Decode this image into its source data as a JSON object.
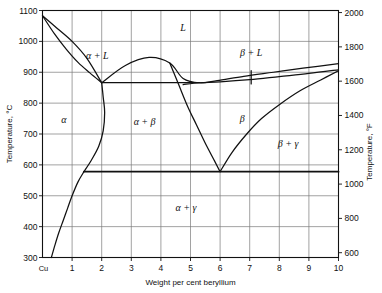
{
  "figure": {
    "kind": "binary-phase-diagram",
    "system": "Cu-Be"
  },
  "axes": {
    "x_title": "Weight per cent beryllium",
    "y_left_title": "Temperature, °C",
    "y_right_title": "Temperature, °F",
    "x_origin_label": "Cu",
    "x_ticks": [
      "1",
      "2",
      "3",
      "4",
      "5",
      "6",
      "7",
      "8",
      "9",
      "10"
    ],
    "x_tick_values": [
      1,
      2,
      3,
      4,
      5,
      6,
      7,
      8,
      9,
      10
    ],
    "x_min": 0,
    "x_max": 10,
    "y_left_ticks": [
      "300",
      "400",
      "500",
      "600",
      "700",
      "800",
      "900",
      "1000",
      "1100"
    ],
    "y_left_tick_values": [
      300,
      400,
      500,
      600,
      700,
      800,
      900,
      1000,
      1100
    ],
    "y_left_min": 300,
    "y_left_max": 1100,
    "y_right_ticks": [
      "600",
      "800",
      "1000",
      "1200",
      "1400",
      "1600",
      "1800",
      "2000"
    ],
    "y_right_tick_values": [
      600,
      800,
      1000,
      1200,
      1400,
      1600,
      1800,
      2000
    ],
    "y_right_min": 572,
    "y_right_max": 2012,
    "grid": true
  },
  "phase_labels": [
    {
      "name": "liquid",
      "text": "L",
      "x": 4.75,
      "y": 1035
    },
    {
      "name": "alpha-plus-liquid",
      "text": "α + L",
      "x": 1.85,
      "y": 943
    },
    {
      "name": "beta-plus-liquid",
      "text": "β + L",
      "x": 7.05,
      "y": 953
    },
    {
      "name": "alpha",
      "text": "α",
      "x": 0.72,
      "y": 737
    },
    {
      "name": "alpha-plus-beta",
      "text": "α + β",
      "x": 3.45,
      "y": 730
    },
    {
      "name": "beta",
      "text": "β",
      "x": 6.75,
      "y": 740
    },
    {
      "name": "beta-plus-gamma",
      "text": "β + γ",
      "x": 8.3,
      "y": 658
    },
    {
      "name": "alpha-plus-gamma",
      "text": "α + γ",
      "x": 4.85,
      "y": 450
    }
  ],
  "chart_data": {
    "type": "line",
    "xlabel": "Weight per cent beryllium",
    "ylabel": "Temperature, °C",
    "ylabel_secondary": "Temperature, °F",
    "xlim": [
      0,
      10
    ],
    "ylim": [
      300,
      1100
    ],
    "ylim_secondary": [
      572,
      2012
    ],
    "grid": true,
    "legend": "none",
    "invariant_reactions": [
      {
        "name": "eutectic-866C",
        "temperature_C": 866,
        "x_start": 2.0,
        "x_end": 5.3
      },
      {
        "name": "eutectoid-578C",
        "temperature_C": 578,
        "x_start": 1.4,
        "x_end": 10.0
      }
    ],
    "key_points": [
      {
        "name": "copper-melting-point",
        "x": 0.0,
        "y": 1083
      },
      {
        "name": "eutectic-point",
        "x": 2.0,
        "y": 866
      },
      {
        "name": "beta-liquidus-minimum",
        "x": 4.75,
        "y": 860
      },
      {
        "name": "eutectoid-point",
        "x": 6.0,
        "y": 578
      },
      {
        "name": "alpha-max-solubility",
        "x": 2.0,
        "y": 866
      },
      {
        "name": "alpha-solvus-bend",
        "x": 1.4,
        "y": 578
      }
    ],
    "series": [
      {
        "name": "alpha-liquidus",
        "points": [
          [
            0.0,
            1083
          ],
          [
            0.4,
            1025
          ],
          [
            0.8,
            975
          ],
          [
            1.2,
            932
          ],
          [
            1.6,
            898
          ],
          [
            2.0,
            866
          ]
        ]
      },
      {
        "name": "alpha-solidus",
        "points": [
          [
            0.0,
            1083
          ],
          [
            0.5,
            1042
          ],
          [
            1.0,
            1000
          ],
          [
            1.5,
            945
          ],
          [
            2.0,
            866
          ]
        ]
      },
      {
        "name": "liquidus-right-of-eutectic",
        "points": [
          [
            2.0,
            866
          ],
          [
            2.8,
            922
          ],
          [
            3.6,
            948
          ],
          [
            4.3,
            930
          ],
          [
            4.75,
            880
          ],
          [
            5.3,
            866
          ],
          [
            5.9,
            873
          ],
          [
            6.8,
            887
          ],
          [
            7.8,
            900
          ],
          [
            8.8,
            913
          ],
          [
            10.0,
            928
          ]
        ]
      },
      {
        "name": "beta-solidus",
        "points": [
          [
            4.75,
            860
          ],
          [
            5.3,
            866
          ],
          [
            6.0,
            869
          ],
          [
            7.0,
            876
          ],
          [
            8.0,
            886
          ],
          [
            9.0,
            896
          ],
          [
            10.0,
            908
          ]
        ]
      },
      {
        "name": "alpha-beta-boundary-upper",
        "points": [
          [
            2.0,
            866
          ],
          [
            2.05,
            820
          ],
          [
            2.1,
            770
          ],
          [
            2.05,
            710
          ],
          [
            1.9,
            660
          ],
          [
            1.65,
            615
          ],
          [
            1.4,
            578
          ]
        ]
      },
      {
        "name": "alpha-solvus",
        "points": [
          [
            1.4,
            578
          ],
          [
            1.2,
            545
          ],
          [
            1.0,
            500
          ],
          [
            0.85,
            460
          ],
          [
            0.7,
            420
          ],
          [
            0.55,
            380
          ],
          [
            0.42,
            340
          ],
          [
            0.3,
            300
          ]
        ]
      },
      {
        "name": "beta-solvus-left",
        "points": [
          [
            4.3,
            930
          ],
          [
            4.6,
            860
          ],
          [
            4.9,
            790
          ],
          [
            5.2,
            730
          ],
          [
            5.5,
            670
          ],
          [
            5.8,
            615
          ],
          [
            6.0,
            578
          ]
        ]
      },
      {
        "name": "beta-gamma-solvus",
        "points": [
          [
            6.0,
            578
          ],
          [
            6.4,
            640
          ],
          [
            6.9,
            700
          ],
          [
            7.4,
            750
          ],
          [
            8.0,
            795
          ],
          [
            8.7,
            840
          ],
          [
            9.4,
            875
          ],
          [
            10.0,
            905
          ]
        ]
      }
    ]
  }
}
